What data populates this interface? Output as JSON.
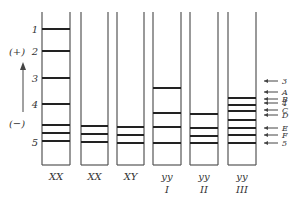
{
  "diagram": {
    "type": "gel-electrophoresis-bands",
    "stroke_color": "#555555",
    "band_color": "#222222",
    "left_scale": {
      "marks": [
        {
          "label": "1",
          "y": 29
        },
        {
          "label": "2",
          "y": 51
        },
        {
          "label": "3",
          "y": 78
        },
        {
          "label": "4",
          "y": 104
        },
        {
          "label": "5",
          "y": 142
        }
      ],
      "plus_label": "(+)",
      "minus_label": "(−)"
    },
    "lanes": [
      {
        "label": "XX",
        "sublabel": "",
        "x1": 42,
        "x2": 70,
        "bands": [
          29,
          51,
          78,
          104,
          125,
          133,
          141
        ]
      },
      {
        "label": "XX",
        "sublabel": "",
        "x1": 81,
        "x2": 108,
        "bands": [
          126,
          134,
          142
        ]
      },
      {
        "label": "XY",
        "sublabel": "",
        "x1": 117,
        "x2": 144,
        "bands": [
          127,
          135,
          143
        ]
      },
      {
        "label": "yy",
        "sublabel": "I",
        "x1": 153,
        "x2": 181,
        "bands": [
          88,
          113,
          127,
          143
        ]
      },
      {
        "label": "yy",
        "sublabel": "II",
        "x1": 190,
        "x2": 218,
        "bands": [
          114,
          128,
          136,
          143
        ]
      },
      {
        "label": "yy",
        "sublabel": "III",
        "x1": 228,
        "x2": 256,
        "bands": [
          98,
          105,
          111,
          120,
          128,
          135,
          143
        ]
      }
    ],
    "right_markers": [
      {
        "label": "3",
        "y": 81
      },
      {
        "label": "A",
        "y": 92
      },
      {
        "label": "B",
        "y": 99
      },
      {
        "label": "4",
        "y": 103
      },
      {
        "label": "C",
        "y": 110
      },
      {
        "label": "D",
        "y": 115
      },
      {
        "label": "E",
        "y": 128
      },
      {
        "label": "F",
        "y": 135
      },
      {
        "label": "5",
        "y": 143
      }
    ]
  }
}
